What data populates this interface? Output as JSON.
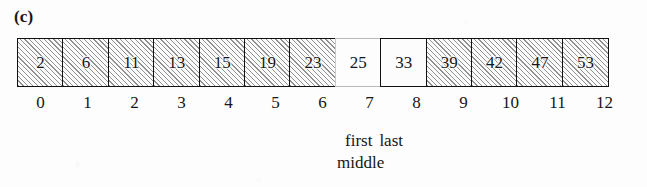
{
  "figure": {
    "panel_label": "(c)",
    "background_color": "#fdfdfd",
    "ink_color": "#161616",
    "hatch_color": "#282828",
    "faint_border_color": "#b9b9b9"
  },
  "array": {
    "cells": [
      {
        "value": "2",
        "index": "0",
        "shaded": true
      },
      {
        "value": "6",
        "index": "1",
        "shaded": true
      },
      {
        "value": "11",
        "index": "2",
        "shaded": true
      },
      {
        "value": "13",
        "index": "3",
        "shaded": true
      },
      {
        "value": "15",
        "index": "4",
        "shaded": true
      },
      {
        "value": "19",
        "index": "5",
        "shaded": true
      },
      {
        "value": "23",
        "index": "6",
        "shaded": true
      },
      {
        "value": "25",
        "index": "7",
        "shaded": false
      },
      {
        "value": "33",
        "index": "8",
        "shaded": false
      },
      {
        "value": "39",
        "index": "9",
        "shaded": true
      },
      {
        "value": "42",
        "index": "10",
        "shaded": true
      },
      {
        "value": "47",
        "index": "11",
        "shaded": true
      },
      {
        "value": "53",
        "index": "12",
        "shaded": true
      }
    ]
  },
  "annotations": {
    "first": "first",
    "last": "last",
    "middle": "middle"
  },
  "chart_data": {
    "type": "table",
    "title": "(c)",
    "categories": [
      "0",
      "1",
      "2",
      "3",
      "4",
      "5",
      "6",
      "7",
      "8",
      "9",
      "10",
      "11",
      "12"
    ],
    "values": [
      2,
      6,
      11,
      13,
      15,
      19,
      23,
      25,
      33,
      39,
      42,
      47,
      53
    ],
    "xlabel": "index",
    "ylabel": "value",
    "shaded_indices": [
      0,
      1,
      2,
      3,
      4,
      5,
      6,
      9,
      10,
      11,
      12
    ],
    "unshaded_indices": [
      7,
      8
    ],
    "pointers": {
      "first": 7,
      "last": 8,
      "middle": 7
    }
  }
}
